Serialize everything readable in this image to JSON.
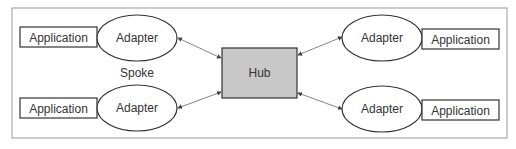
{
  "diagram": {
    "hub": {
      "label": "Hub",
      "fill": "#c8c8c8"
    },
    "spoke_label": "Spoke",
    "spokes": [
      {
        "position": "top-left",
        "adapter": "Adapter",
        "application": "Application"
      },
      {
        "position": "bottom-left",
        "adapter": "Adapter",
        "application": "Application"
      },
      {
        "position": "top-right",
        "adapter": "Adapter",
        "application": "Application"
      },
      {
        "position": "bottom-right",
        "adapter": "Adapter",
        "application": "Application"
      }
    ]
  }
}
